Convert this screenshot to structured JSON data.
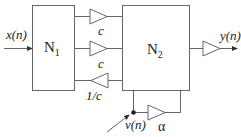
{
  "diagram": {
    "type": "signal-flow block diagram",
    "blocks": [
      {
        "id": "N1",
        "label": "N",
        "subscript": "1"
      },
      {
        "id": "N2",
        "label": "N",
        "subscript": "2"
      }
    ],
    "input": {
      "label": "x(n)"
    },
    "output": {
      "label": "y(n)"
    },
    "noise": {
      "label": "v(n)"
    },
    "gains": [
      {
        "label": "c",
        "direction": "N1 to N2"
      },
      {
        "label": "c",
        "direction": "N1 to N2"
      },
      {
        "label": "1/c",
        "direction": "N2 to N1"
      },
      {
        "label": "α",
        "direction": "feedback around N2"
      }
    ],
    "colors": {
      "line": "#555555",
      "text": "#222222",
      "background": "#ffffff"
    }
  }
}
